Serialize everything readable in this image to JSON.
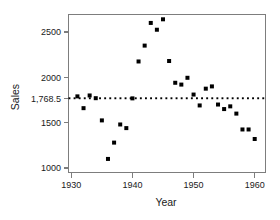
{
  "chart_data": {
    "type": "scatter",
    "title": "",
    "xlabel": "Year",
    "ylabel": "Sales",
    "xlim": [
      1930,
      1961
    ],
    "ylim": [
      1000,
      2700
    ],
    "grid": false,
    "legend": null,
    "x": [
      1931,
      1932,
      1933,
      1934,
      1935,
      1936,
      1937,
      1938,
      1939,
      1940,
      1941,
      1942,
      1943,
      1944,
      1945,
      1946,
      1947,
      1948,
      1949,
      1950,
      1951,
      1952,
      1953,
      1954,
      1955,
      1956,
      1957,
      1958,
      1959,
      1960
    ],
    "y": [
      1790,
      1660,
      1800,
      1770,
      1525,
      1100,
      1280,
      1480,
      1440,
      1768,
      2175,
      2350,
      2600,
      2525,
      2640,
      2180,
      1940,
      1920,
      1995,
      1810,
      1690,
      1875,
      1900,
      1700,
      1650,
      1680,
      1600,
      1425,
      1425,
      1320
    ],
    "xticks": [
      1930,
      1940,
      1950,
      1960
    ],
    "xticklabels": [
      "1930",
      "1940",
      "1950",
      "1960"
    ],
    "yticks": [
      1000,
      1500,
      1768.5,
      2000,
      2500
    ],
    "yticklabels": [
      "1000",
      "1500",
      "1,768.5",
      "2000",
      "2500"
    ],
    "reference_line": {
      "orientation": "horizontal",
      "value": 1768.5,
      "label": "1,768.5",
      "style": "dotted",
      "color": "#000000"
    },
    "marker": {
      "shape": "square",
      "color": "#000000",
      "size": 4
    }
  },
  "axes": {
    "x_title": "Year",
    "y_title": "Sales"
  },
  "colors": {
    "marker": "#000000",
    "axis": "#7d7d7d",
    "reference_line": "#000000",
    "background": "#ffffff"
  }
}
